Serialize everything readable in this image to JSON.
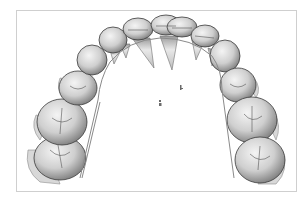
{
  "image": {
    "subject": "3D dental arch model with orthodontic wire",
    "background_color": "#ffffff",
    "frame_border_color": "#cfcfcf",
    "tooth_fill_light": "#e6e6e6",
    "tooth_fill_mid": "#a8a8a8",
    "tooth_outline": "#3a3a3a",
    "wire_color": "#8a8a8a"
  },
  "teeth": [
    {
      "id": "L-molar-2",
      "cx": 60,
      "cy": 158,
      "rx": 26,
      "ry": 22
    },
    {
      "id": "L-molar-1",
      "cx": 62,
      "cy": 122,
      "rx": 25,
      "ry": 23
    },
    {
      "id": "L-premolar-2",
      "cx": 78,
      "cy": 88,
      "rx": 19,
      "ry": 17
    },
    {
      "id": "L-premolar-1",
      "cx": 92,
      "cy": 60,
      "rx": 15,
      "ry": 15
    },
    {
      "id": "L-canine",
      "cx": 113,
      "cy": 40,
      "rx": 14,
      "ry": 13
    },
    {
      "id": "L-lateral",
      "cx": 138,
      "cy": 29,
      "rx": 15,
      "ry": 11
    },
    {
      "id": "L-central",
      "cx": 166,
      "cy": 25,
      "rx": 15,
      "ry": 10
    },
    {
      "id": "R-central",
      "cx": 182,
      "cy": 27,
      "rx": 15,
      "ry": 10
    },
    {
      "id": "R-lateral",
      "cx": 205,
      "cy": 36,
      "rx": 14,
      "ry": 11
    },
    {
      "id": "R-canine",
      "cx": 225,
      "cy": 56,
      "rx": 15,
      "ry": 16
    },
    {
      "id": "R-premolar-1",
      "cx": 238,
      "cy": 85,
      "rx": 18,
      "ry": 17
    },
    {
      "id": "R-molar-1",
      "cx": 252,
      "cy": 120,
      "rx": 25,
      "ry": 23
    },
    {
      "id": "R-molar-2",
      "cx": 260,
      "cy": 160,
      "rx": 25,
      "ry": 23
    }
  ]
}
